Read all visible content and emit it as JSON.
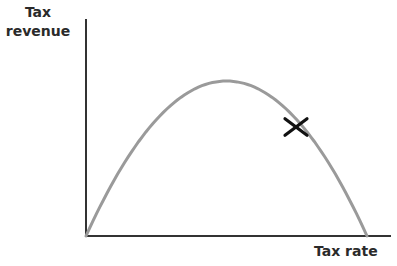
{
  "chart_data": {
    "type": "line",
    "title": "",
    "xlabel": "Tax rate",
    "ylabel_lines": [
      "Tax",
      "revenue"
    ],
    "ylabel": "Tax revenue",
    "grid": false,
    "legend": null,
    "series": [
      {
        "name": "Laffer curve",
        "x": [
          0,
          0.1,
          0.2,
          0.3,
          0.4,
          0.5,
          0.6,
          0.7,
          0.8,
          0.9,
          1.0
        ],
        "values": [
          0,
          0.36,
          0.64,
          0.84,
          0.96,
          1.0,
          0.96,
          0.84,
          0.64,
          0.36,
          0
        ]
      }
    ],
    "annotations": [
      {
        "type": "marker",
        "symbol": "x",
        "x": 0.75,
        "y": 0.7,
        "label": ""
      }
    ],
    "colors": {
      "axis": "#333333",
      "curve": "#9a9a9a",
      "marker": "#111111"
    }
  }
}
